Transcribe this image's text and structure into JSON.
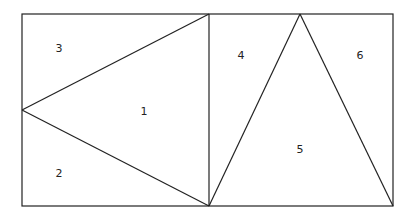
{
  "diagram": {
    "stroke_color": "#222222",
    "background": "#ffffff",
    "regions": [
      {
        "id": "1",
        "label": "1"
      },
      {
        "id": "2",
        "label": "2"
      },
      {
        "id": "3",
        "label": "3"
      },
      {
        "id": "4",
        "label": "4"
      },
      {
        "id": "5",
        "label": "5"
      },
      {
        "id": "6",
        "label": "6"
      }
    ]
  }
}
